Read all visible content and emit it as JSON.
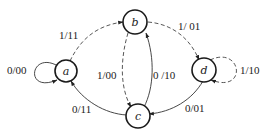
{
  "diagram": {
    "type": "state-transition-diagram",
    "nodes": [
      {
        "id": "a",
        "label": "a"
      },
      {
        "id": "b",
        "label": "b"
      },
      {
        "id": "c",
        "label": "c"
      },
      {
        "id": "d",
        "label": "d"
      }
    ],
    "edges": [
      {
        "from": "a",
        "to": "a",
        "label": "0/00",
        "style": "solid"
      },
      {
        "from": "a",
        "to": "b",
        "label": "1/11",
        "style": "dashed"
      },
      {
        "from": "b",
        "to": "d",
        "label": "1/01",
        "style": "dashed"
      },
      {
        "from": "b",
        "to": "c",
        "label": "1/00",
        "style": "dashed"
      },
      {
        "from": "c",
        "to": "b",
        "label": "0/10",
        "style": "solid"
      },
      {
        "from": "c",
        "to": "a",
        "label": "0/11",
        "style": "solid"
      },
      {
        "from": "d",
        "to": "c",
        "label": "0/01",
        "style": "solid"
      },
      {
        "from": "d",
        "to": "d",
        "label": "1/10",
        "style": "dashed"
      }
    ]
  },
  "labels": {
    "node_a": "a",
    "node_b": "b",
    "node_c": "c",
    "node_d": "d",
    "edge_aa": "0/00",
    "edge_ab": "1/11",
    "edge_bd": "1/ 01",
    "edge_bc": "1/00",
    "edge_cb": "0 /10",
    "edge_ca": "0/11",
    "edge_dc": "0/01",
    "edge_dd": "1/10"
  }
}
